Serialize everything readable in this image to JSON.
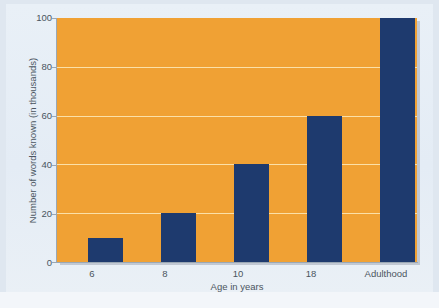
{
  "chart_data": {
    "type": "bar",
    "title": "",
    "categories": [
      "6",
      "8",
      "10",
      "18",
      "Adulthood"
    ],
    "values": [
      10,
      20,
      40,
      60,
      100
    ],
    "series": [
      {
        "name": "Number of words known (in thousands)",
        "values": [
          10,
          20,
          40,
          60,
          100
        ]
      }
    ],
    "xlabel": "Age in years",
    "ylabel": "Number of words known (in thousands)",
    "ylim": [
      0,
      100
    ],
    "yticks": [
      "0",
      "20",
      "40",
      "60",
      "80",
      "100"
    ],
    "ytick_values": [
      0,
      20,
      40,
      60,
      80,
      100
    ],
    "grid": true,
    "legend": false,
    "colors": {
      "bar": "#1e3a6e",
      "plot_background": "#f0a134",
      "gridline": "#fbe0a8",
      "figure_background": "#e6eef6",
      "axis": "#9aa7b4",
      "text": "#4a5560"
    }
  }
}
